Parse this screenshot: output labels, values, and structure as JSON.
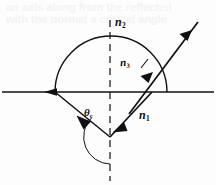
{
  "figure": {
    "background_color": "#fdfdfd",
    "ink_color": "#111111",
    "width": 216,
    "height": 185
  },
  "labels": {
    "n2": {
      "symbol": "n",
      "subscript": "2",
      "meaning": "refractive index of upper medium"
    },
    "n3": {
      "symbol": "n",
      "subscript": "3",
      "meaning": "refractive index of outgoing ray medium"
    },
    "n1": {
      "symbol": "n",
      "subscript": "1",
      "meaning": "refractive index of lower medium"
    },
    "theta_c": {
      "symbol": "θ",
      "subscript": "c",
      "meaning": "critical angle"
    }
  },
  "geometry": {
    "interface_line": {
      "x1": 2,
      "y1": 92,
      "x2": 214,
      "y2": 92,
      "name": "horizontal-interface"
    },
    "semicircle": {
      "cx": 111,
      "cy": 92,
      "r": 56,
      "name": "semicircular-boundary"
    },
    "normal_dashed": {
      "x": 110,
      "y1": 20,
      "y2": 181,
      "name": "dashed-normal-axis"
    },
    "incident_ray_left": {
      "x1": 55,
      "y1": 92,
      "x2": 110,
      "y2": 137
    },
    "reflected_ray_right": {
      "x1": 110,
      "y1": 137,
      "x2": 152,
      "y2": 92
    },
    "outgoing_ray": {
      "x1": 128,
      "y1": 112,
      "x2": 198,
      "y2": 22
    },
    "horizontal_arrow_tip_x": 44,
    "angle_arc": {
      "cx": 110,
      "cy": 137,
      "r": 26
    }
  },
  "ghost_text": {
    "line1": "an axis along from the reflected",
    "line2": "with the normal a critical angle"
  }
}
